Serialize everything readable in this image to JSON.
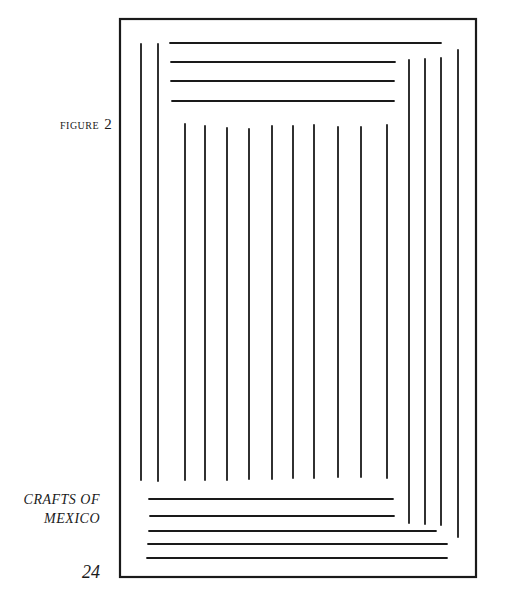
{
  "figure": {
    "caption_word": "FIGURE",
    "caption_number": "2",
    "frame": {
      "x1": 120,
      "y1": 19,
      "x2": 476,
      "y2": 577
    },
    "lines": {
      "left_verticals": [
        {
          "x": 141,
          "y1": 44,
          "y2": 480
        },
        {
          "x": 158,
          "y1": 44,
          "y2": 481
        }
      ],
      "top_horizontals": [
        {
          "y": 43,
          "x1": 170,
          "x2": 441
        },
        {
          "y": 62,
          "x1": 171,
          "x2": 395
        },
        {
          "y": 81,
          "x1": 171,
          "x2": 394
        },
        {
          "y": 101,
          "x1": 172,
          "x2": 394
        }
      ],
      "middle_verticals": [
        {
          "x": 185,
          "y1": 124,
          "y2": 480
        },
        {
          "x": 205,
          "y1": 126,
          "y2": 480
        },
        {
          "x": 227,
          "y1": 128,
          "y2": 480
        },
        {
          "x": 249,
          "y1": 129,
          "y2": 479
        },
        {
          "x": 272,
          "y1": 126,
          "y2": 479
        },
        {
          "x": 293,
          "y1": 126,
          "y2": 478
        },
        {
          "x": 314,
          "y1": 125,
          "y2": 478
        },
        {
          "x": 338,
          "y1": 127,
          "y2": 477
        },
        {
          "x": 361,
          "y1": 127,
          "y2": 477
        },
        {
          "x": 387,
          "y1": 125,
          "y2": 478
        }
      ],
      "right_verticals": [
        {
          "x": 409,
          "y1": 60,
          "y2": 523
        },
        {
          "x": 425,
          "y1": 59,
          "y2": 524
        },
        {
          "x": 441,
          "y1": 58,
          "y2": 525
        },
        {
          "x": 458,
          "y1": 50,
          "y2": 537
        }
      ],
      "bottom_horizontals": [
        {
          "y": 499,
          "x1": 149,
          "x2": 393
        },
        {
          "y": 516,
          "x1": 150,
          "x2": 394
        },
        {
          "y": 531,
          "x1": 149,
          "x2": 436
        },
        {
          "y": 544,
          "x1": 148,
          "x2": 447
        },
        {
          "y": 558,
          "x1": 147,
          "x2": 447
        }
      ]
    },
    "stroke_color": "#1a1a1a"
  },
  "side_text": {
    "line1": "CRAFTS OF",
    "line2": "MEXICO"
  },
  "page_number": "24"
}
